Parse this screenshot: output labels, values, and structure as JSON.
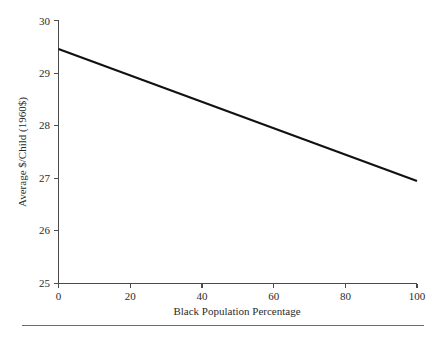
{
  "chart_data": {
    "type": "line",
    "title": "",
    "xlabel": "Black Population Percentage",
    "ylabel": "Average $/Child (1960$)",
    "xlim": [
      0,
      100
    ],
    "ylim": [
      25,
      30
    ],
    "xticks": [
      0,
      20,
      40,
      60,
      80,
      100
    ],
    "xtick_labels": [
      "0",
      "20",
      "40",
      "60",
      "80",
      "100"
    ],
    "yticks": [
      25,
      26,
      27,
      28,
      29,
      30
    ],
    "ytick_labels": [
      "25",
      "26",
      "27",
      "28",
      "29",
      "30"
    ],
    "grid": false,
    "legend": "none",
    "series": [
      {
        "name": "Average $/Child (1960$)",
        "color": "#111111",
        "x": [
          0,
          100
        ],
        "values": [
          29.45,
          26.94
        ]
      }
    ],
    "annotations": []
  },
  "figure": {
    "axis_color": "#4a4a4a",
    "line_color": "#111111",
    "background": "#ffffff",
    "footer_rule_color": "#6e6e6e"
  }
}
